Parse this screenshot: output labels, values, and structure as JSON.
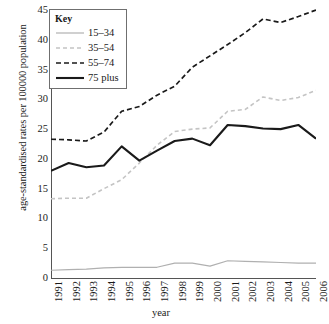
{
  "chart_data": {
    "type": "line",
    "title": "",
    "xlabel": "year",
    "ylabel": "age-standardised rates per 100000 population",
    "x": [
      1991,
      1992,
      1993,
      1994,
      1995,
      1996,
      1997,
      1998,
      1999,
      2000,
      2001,
      2002,
      2003,
      2004,
      2005,
      2006
    ],
    "categories": [
      "1991",
      "1992",
      "1993",
      "1994",
      "1995",
      "1996",
      "1997",
      "1998",
      "1999",
      "2000",
      "2001",
      "2002",
      "2003",
      "2004",
      "2005",
      "2006"
    ],
    "xlim": [
      1991,
      2006
    ],
    "ylim": [
      0,
      45
    ],
    "yticks": [
      0,
      5,
      10,
      15,
      20,
      25,
      30,
      35,
      40,
      45
    ],
    "grid": false,
    "legend_position": "top-left",
    "legend_title": "Key",
    "series": [
      {
        "name": "15–34",
        "color": "#b0b0b0",
        "style": "solid",
        "width": 1.2,
        "values": [
          1.3,
          1.4,
          1.5,
          1.7,
          1.8,
          1.8,
          1.8,
          2.5,
          2.5,
          2.0,
          2.9,
          2.8,
          2.7,
          2.6,
          2.5,
          2.5
        ]
      },
      {
        "name": "35–54",
        "color": "#c4c4c4",
        "style": "dashed",
        "width": 1.6,
        "values": [
          13.3,
          13.4,
          13.4,
          15.0,
          16.5,
          19.3,
          22.3,
          24.6,
          25.0,
          25.2,
          28.0,
          28.3,
          30.4,
          29.8,
          30.3,
          31.5
        ]
      },
      {
        "name": "55–74",
        "color": "#1a1a1a",
        "style": "dashed",
        "width": 1.7,
        "values": [
          23.3,
          23.2,
          23.0,
          24.5,
          28.0,
          28.8,
          30.7,
          32.2,
          35.4,
          37.3,
          39.2,
          41.2,
          43.5,
          42.9,
          43.9,
          45.0
        ]
      },
      {
        "name": "75 plus",
        "color": "#1a1a1a",
        "style": "solid",
        "width": 2.1,
        "values": [
          18.0,
          19.3,
          18.6,
          18.9,
          22.1,
          19.7,
          21.4,
          23.0,
          23.4,
          22.3,
          25.7,
          25.5,
          25.1,
          25.0,
          25.7,
          23.4
        ]
      }
    ]
  },
  "axis": {
    "y_tick_labels": [
      "45",
      "40",
      "35",
      "30",
      "25",
      "20",
      "15",
      "10",
      "5",
      "0"
    ],
    "x_tick_labels": [
      "1991",
      "1992",
      "1993",
      "1994",
      "1995",
      "1996",
      "1997",
      "1998",
      "1999",
      "2000",
      "2001",
      "2002",
      "2003",
      "2004",
      "2005",
      "2006"
    ],
    "x_title": "year",
    "y_title": "age-standardised rates per 100000 population"
  },
  "legend": {
    "title": "Key",
    "items": [
      {
        "label": "15–34"
      },
      {
        "label": "35–54"
      },
      {
        "label": "55–74"
      },
      {
        "label": "75 plus"
      }
    ]
  }
}
